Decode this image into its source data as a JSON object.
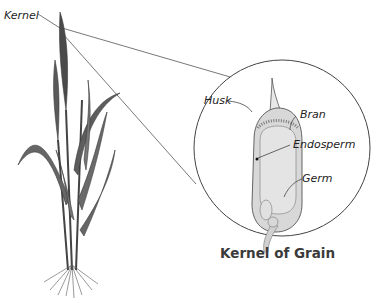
{
  "diagram": {
    "title": "Kernel of Grain",
    "plant_label": "Kernel",
    "labels": {
      "husk": "Husk",
      "bran": "Bran",
      "endosperm": "Endosperm",
      "germ": "Germ"
    },
    "colors": {
      "line": "#555555",
      "plant": "#4a4a4a",
      "kernel_fill": "#e2e2e2",
      "background": "#ffffff"
    }
  }
}
